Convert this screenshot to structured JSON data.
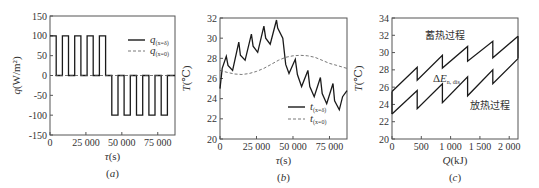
{
  "chart_data": [
    {
      "id": "a",
      "type": "line",
      "caption": "(a)",
      "xlabel": "τ(s)",
      "ylabel": "q(W/m²)",
      "xlim": [
        0,
        87000
      ],
      "ylim": [
        -150,
        150
      ],
      "xticks": [
        0,
        25000,
        50000,
        75000
      ],
      "xtick_labels": [
        "0",
        "25 000",
        "50 000",
        "75 000"
      ],
      "yticks": [
        -150,
        -100,
        -50,
        0,
        50,
        100,
        150
      ],
      "ytick_labels": [
        "-150",
        "-100",
        "-50",
        "0",
        "50",
        "100",
        "150"
      ],
      "grid": false,
      "legend_position": "upper right",
      "series": [
        {
          "name": "q(x=δ)",
          "style": "solid",
          "x": [
            0,
            4300,
            4300,
            8600,
            8600,
            12900,
            12900,
            17200,
            17200,
            21500,
            21500,
            25800,
            25800,
            30100,
            30100,
            34400,
            34400,
            38700,
            38700,
            43000,
            43000,
            47300,
            47300,
            51600,
            51600,
            55900,
            55900,
            60200,
            60200,
            64500,
            64500,
            68800,
            68800,
            73100,
            73100,
            77400,
            77400,
            81700,
            81700,
            87000
          ],
          "y": [
            100,
            100,
            0,
            0,
            100,
            100,
            0,
            0,
            100,
            100,
            0,
            0,
            100,
            100,
            0,
            0,
            100,
            100,
            0,
            0,
            -100,
            -100,
            0,
            0,
            -100,
            -100,
            0,
            0,
            -100,
            -100,
            0,
            0,
            -100,
            -100,
            0,
            0,
            -100,
            -100,
            0,
            0
          ]
        },
        {
          "name": "q(x=0)",
          "style": "dashed",
          "x": [
            0,
            87000
          ],
          "y": [
            0,
            0
          ]
        }
      ]
    },
    {
      "id": "b",
      "type": "line",
      "caption": "(b)",
      "xlabel": "τ(s)",
      "ylabel": "T(℃)",
      "xlim": [
        0,
        87000
      ],
      "ylim": [
        20,
        32
      ],
      "xticks": [
        0,
        25000,
        50000,
        75000
      ],
      "xtick_labels": [
        "0",
        "25 000",
        "50 000",
        "75 000"
      ],
      "yticks": [
        20,
        22,
        24,
        26,
        28,
        30,
        32
      ],
      "ytick_labels": [
        "20",
        "22",
        "24",
        "26",
        "28",
        "30",
        "32"
      ],
      "grid": false,
      "legend_position": "lower right",
      "series": [
        {
          "name": "t(x=δ)",
          "style": "solid",
          "x": [
            0,
            1500,
            4300,
            5500,
            8600,
            12900,
            14000,
            17200,
            21500,
            22700,
            25800,
            30100,
            31300,
            34400,
            38700,
            39500,
            43000,
            45000,
            47300,
            51600,
            53000,
            55900,
            60200,
            61500,
            64500,
            68800,
            70000,
            73100,
            77400,
            78500,
            81700,
            84000,
            87000
          ],
          "y": [
            25.0,
            27.0,
            28.2,
            27.3,
            26.8,
            29.6,
            28.3,
            27.8,
            30.4,
            29.2,
            28.6,
            31.2,
            30.0,
            29.4,
            31.8,
            31.0,
            30.0,
            27.4,
            26.5,
            27.9,
            26.4,
            25.2,
            26.8,
            25.2,
            24.2,
            26.1,
            24.5,
            23.5,
            25.5,
            23.8,
            22.9,
            24.2,
            24.8
          ]
        },
        {
          "name": "t(x=0)",
          "style": "dashed",
          "x": [
            0,
            5000,
            10000,
            15000,
            20000,
            25000,
            30000,
            35000,
            40000,
            45000,
            50000,
            55000,
            60000,
            65000,
            70000,
            75000,
            80000,
            87000
          ],
          "y": [
            26.8,
            26.6,
            26.45,
            26.4,
            26.5,
            26.7,
            27.0,
            27.4,
            27.8,
            28.1,
            28.25,
            28.3,
            28.25,
            28.1,
            27.8,
            27.5,
            27.3,
            27.0
          ]
        }
      ]
    },
    {
      "id": "c",
      "type": "line",
      "caption": "(c)",
      "xlabel": "Q(kJ)",
      "ylabel": "T(℃)",
      "xlim": [
        0,
        2150
      ],
      "ylim": [
        20,
        34
      ],
      "xticks": [
        0,
        500,
        1000,
        1500,
        2000
      ],
      "xtick_labels": [
        "0",
        "500",
        "1 000",
        "1 500",
        "2 000"
      ],
      "yticks": [
        20,
        22,
        24,
        26,
        28,
        30,
        32,
        34
      ],
      "ytick_labels": [
        "20",
        "22",
        "24",
        "26",
        "28",
        "30",
        "32",
        "34"
      ],
      "grid": false,
      "annotations": [
        "蓄热过程",
        "放热过程",
        "ΔE_n,dis"
      ],
      "series": [
        {
          "name": "upper branch (charging)",
          "style": "solid",
          "x": [
            0,
            430,
            430,
            860,
            860,
            1290,
            1290,
            1720,
            1720,
            2150
          ],
          "y": [
            25.5,
            28.3,
            26.8,
            29.7,
            28.2,
            30.7,
            29.0,
            31.3,
            29.4,
            31.9
          ]
        },
        {
          "name": "lower branch (discharging)",
          "style": "solid",
          "x": [
            0,
            430,
            430,
            860,
            860,
            1290,
            1290,
            1720,
            1720,
            2150
          ],
          "y": [
            22.9,
            25.6,
            23.5,
            26.4,
            24.2,
            27.2,
            25.0,
            28.0,
            26.4,
            29.3
          ]
        }
      ]
    }
  ],
  "panels": {
    "a": {
      "caption": "(a)",
      "xlabel": "τ(s)",
      "ylabel": "q(W/m²)",
      "legend": [
        "q(x=δ)",
        "q(x=0)"
      ]
    },
    "b": {
      "caption": "(b)",
      "xlabel": "τ(s)",
      "ylabel": "T(℃)",
      "legend": [
        "t(x=δ)",
        "t(x=0)"
      ]
    },
    "c": {
      "caption": "(c)",
      "xlabel": "Q(kJ)",
      "ylabel": "T(℃)",
      "label_charge": "蓄热过程",
      "label_discharge": "放热过程",
      "label_delta": "ΔE",
      "label_delta_sub": "n, dis"
    }
  },
  "colors": {
    "line": "#1a1a1a",
    "axis": "#555555",
    "text": "#333333"
  }
}
